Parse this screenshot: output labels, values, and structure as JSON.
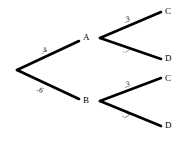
{
  "diagram": {
    "type": "probability-tree",
    "title": "",
    "background_color": "#ffffff",
    "branch_color": "#000000",
    "label_color": "#000000",
    "nodes": {
      "root": {
        "label": "",
        "x": 17,
        "y": 70
      },
      "a": {
        "label": "A",
        "x": 86,
        "y": 38
      },
      "b": {
        "label": "B",
        "x": 86,
        "y": 101
      },
      "c1": {
        "label": "C",
        "x": 168,
        "y": 13
      },
      "d1": {
        "label": "D",
        "x": 168,
        "y": 60
      },
      "c2": {
        "label": "C",
        "x": 168,
        "y": 80
      },
      "d2": {
        "label": "D",
        "x": 168,
        "y": 127
      }
    },
    "probabilities": {
      "root_to_a": ".4",
      "root_to_b": ".6",
      "a_to_c": ".3",
      "a_to_d": ".7",
      "b_to_c": ".3",
      "b_to_d": ".7"
    }
  }
}
